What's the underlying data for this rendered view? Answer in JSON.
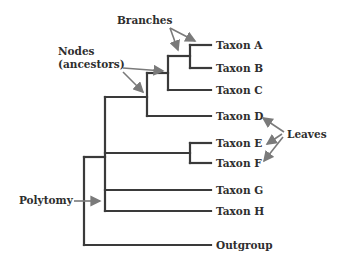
{
  "diagram": {
    "type": "phylogenetic-tree",
    "colors": {
      "branch": "#3a3a3a",
      "arrow": "#7a7a7a",
      "text": "#2e2e2e"
    },
    "leaves": [
      {
        "label": "Taxon A"
      },
      {
        "label": "Taxon B"
      },
      {
        "label": "Taxon C"
      },
      {
        "label": "Taxon D"
      },
      {
        "label": "Taxon E"
      },
      {
        "label": "Taxon F"
      },
      {
        "label": "Taxon G"
      },
      {
        "label": "Taxon H"
      },
      {
        "label": "Outgroup"
      }
    ],
    "annotations": {
      "branches": "Branches",
      "nodes_line1": "Nodes",
      "nodes_line2": "(ancestors)",
      "leaves": "Leaves",
      "polytomy": "Polytomy"
    }
  }
}
